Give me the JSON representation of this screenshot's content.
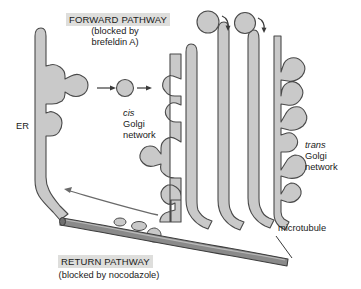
{
  "figure": {
    "title_visible": false,
    "background_color": "#ffffff",
    "organelle_fill": "#c9c9c9",
    "organelle_stroke": "#4a4a4a",
    "microtubule_fill": "#8a8a8a",
    "microtubule_stroke": "#3c3c3c",
    "highlight_band_color": "#dededc",
    "text_color": "#1a1a1a"
  },
  "labels": {
    "forward_pathway": {
      "heading": "FORWARD PATHWAY",
      "note_line1": "(blocked by",
      "note_line2": "brefeldin A)"
    },
    "return_pathway": {
      "heading": "RETURN PATHWAY",
      "note": "(blocked by nocodazole)"
    },
    "er": "ER",
    "cis_golgi": {
      "emphasis": "cis",
      "line2": "Golgi",
      "line3": "network"
    },
    "trans_golgi": {
      "emphasis": "trans",
      "line2": "Golgi",
      "line3": "network"
    },
    "microtubule": "microtubule"
  },
  "structures": {
    "er_label": "endoplasmic reticulum",
    "cis_golgi_network_label": "cis Golgi network",
    "golgi_cisternae_count": 4,
    "trans_golgi_network_label": "trans Golgi network",
    "transport_vesicles_forward": 1,
    "secretory_vesicles_top": 2,
    "return_vesicles_on_microtubule": 3,
    "arrows": {
      "forward_arrows": 2,
      "return_arrow": 1,
      "budding_arrows_top": 2
    }
  }
}
